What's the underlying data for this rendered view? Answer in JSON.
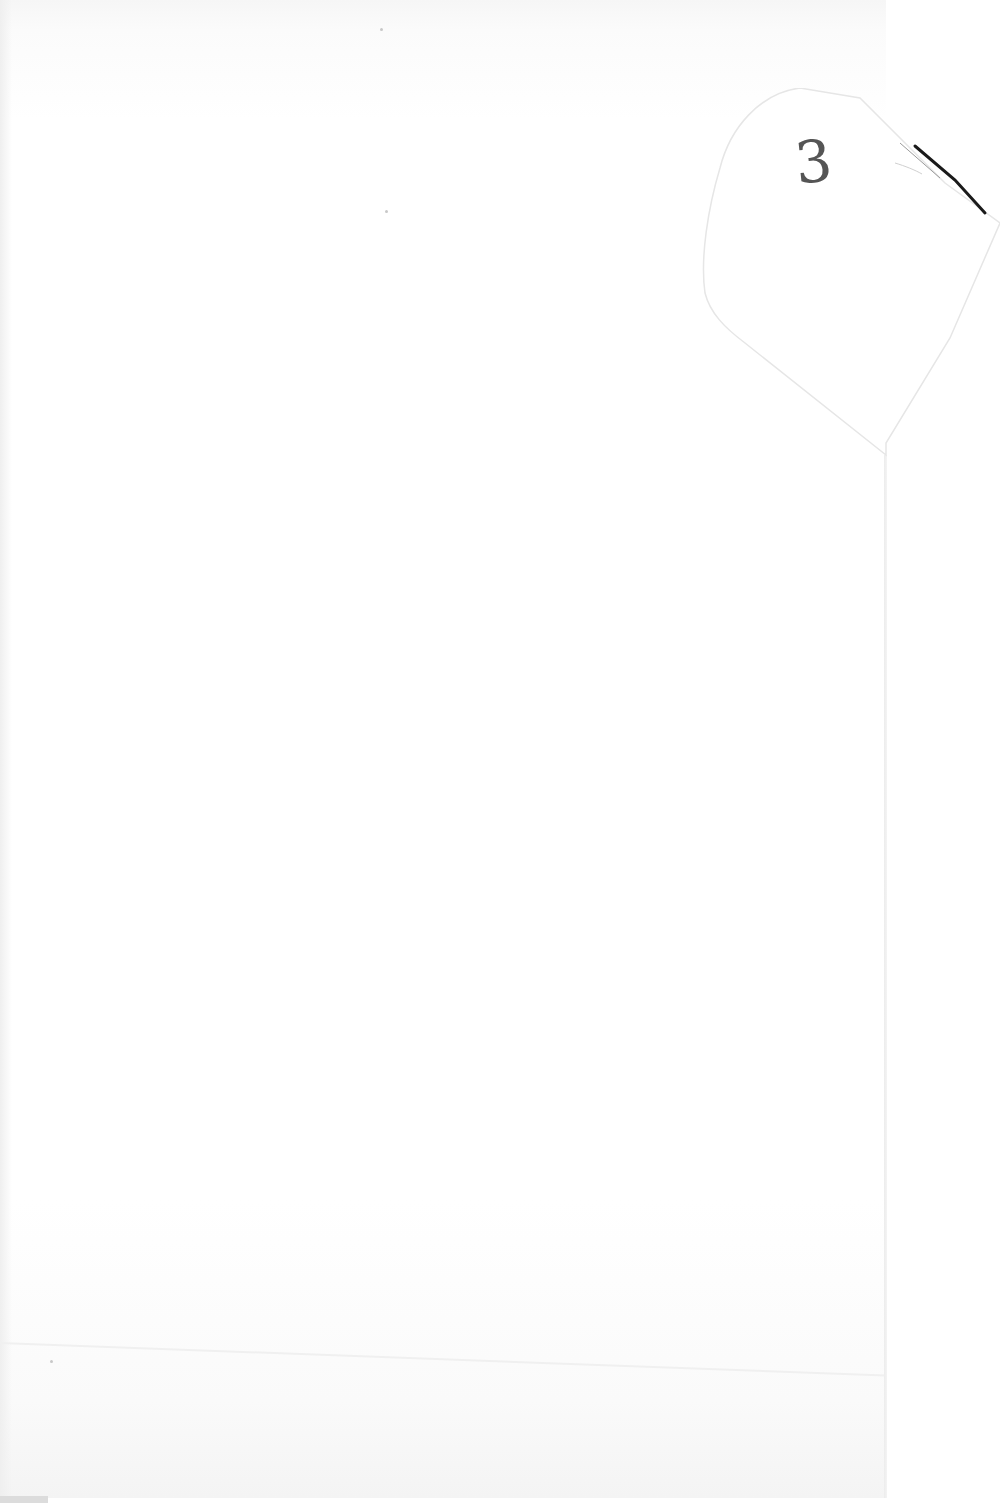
{
  "document": {
    "type": "blank scanned page",
    "page_marker": {
      "text": "3",
      "style": "handwritten",
      "location": "folded corner tab, upper right"
    }
  },
  "colors": {
    "paper": "#ffffff",
    "ink": "#555555",
    "fold_shadow": "#1a1a1a"
  }
}
